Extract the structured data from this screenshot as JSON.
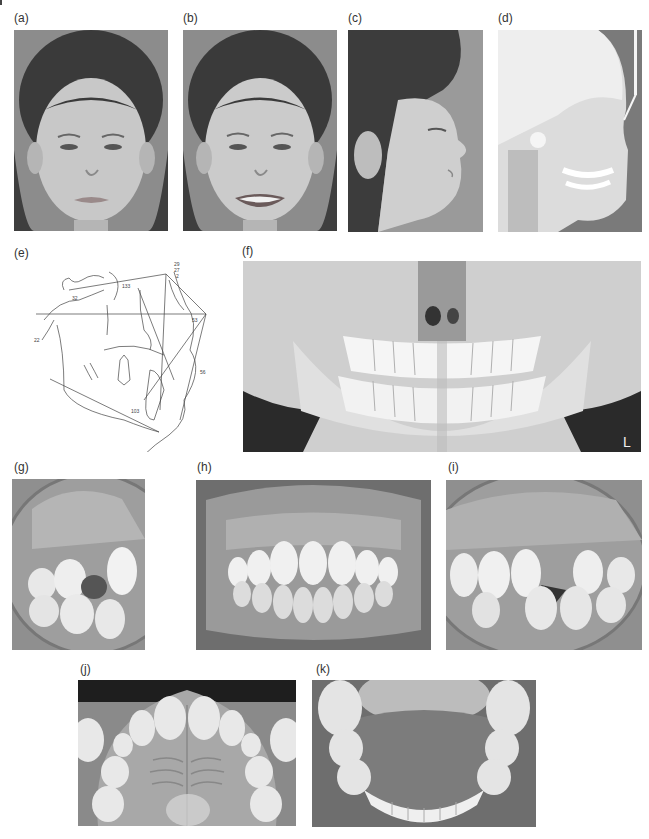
{
  "figure": {
    "panels": [
      {
        "id": "a",
        "label": "(a)",
        "content": "frontal facial photograph, lips at rest"
      },
      {
        "id": "b",
        "label": "(b)",
        "content": "frontal facial photograph, smiling"
      },
      {
        "id": "c",
        "label": "(c)",
        "content": "right profile facial photograph"
      },
      {
        "id": "d",
        "label": "(d)",
        "content": "lateral cephalometric radiograph"
      },
      {
        "id": "e",
        "label": "(e)",
        "content": "cephalometric tracing"
      },
      {
        "id": "f",
        "label": "(f)",
        "content": "panoramic radiograph"
      },
      {
        "id": "g",
        "label": "(g)",
        "content": "right buccal intraoral photograph"
      },
      {
        "id": "h",
        "label": "(h)",
        "content": "frontal intraoral photograph"
      },
      {
        "id": "i",
        "label": "(i)",
        "content": "left buccal intraoral photograph"
      },
      {
        "id": "j",
        "label": "(j)",
        "content": "maxillary occlusal photograph"
      },
      {
        "id": "k",
        "label": "(k)",
        "content": "mandibular occlusal photograph"
      }
    ],
    "tracing_labels": {
      "top_stack": [
        "29",
        "27",
        "2"
      ],
      "snl": "133",
      "sn": "32",
      "fma": "22",
      "ant": "53",
      "lower_face": "56",
      "impa": "103"
    },
    "panoramic_marker": "L"
  }
}
